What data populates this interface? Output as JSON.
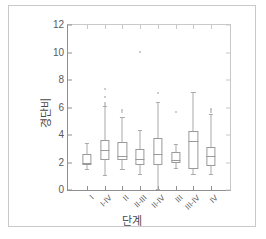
{
  "chart_data": {
    "type": "box",
    "title": "",
    "xlabel": "단계",
    "ylabel": "경단비",
    "ylim": [
      0,
      12
    ],
    "yticks": [
      0,
      2,
      4,
      6,
      8,
      10,
      12
    ],
    "ytick_labels": [
      "0",
      "2",
      "4",
      "6",
      "8",
      "10",
      "12"
    ],
    "grid": false,
    "legend": "none",
    "categories": [
      "I",
      "I-IV",
      "II",
      "II-III",
      "II-IV",
      "III",
      "III-IV",
      "IV"
    ],
    "boxes": [
      {
        "category": "I",
        "whisker_low": 1.55,
        "q1": 1.8,
        "median": 2.0,
        "q3": 2.6,
        "whisker_high": 3.4,
        "outliers": []
      },
      {
        "category": "I-IV",
        "whisker_low": 1.1,
        "q1": 2.15,
        "median": 2.9,
        "q3": 3.65,
        "whisker_high": 6.1,
        "outliers": [
          6.3,
          6.5,
          6.9,
          7.5
        ]
      },
      {
        "category": "II",
        "whisker_low": 1.5,
        "q1": 2.15,
        "median": 2.5,
        "q3": 3.5,
        "whisker_high": 5.3,
        "outliers": [
          5.8,
          6.0
        ]
      },
      {
        "category": "II-III",
        "whisker_low": 1.15,
        "q1": 1.85,
        "median": 2.25,
        "q3": 2.95,
        "whisker_high": 4.35,
        "outliers": [
          10.2
        ]
      },
      {
        "category": "II-IV",
        "whisker_low": 0.1,
        "q1": 1.85,
        "median": 2.6,
        "q3": 3.8,
        "whisker_high": 6.4,
        "outliers": [
          7.2
        ]
      },
      {
        "category": "III",
        "whisker_low": 1.6,
        "q1": 2.0,
        "median": 2.15,
        "q3": 2.75,
        "whisker_high": 3.35,
        "outliers": [
          5.8
        ]
      },
      {
        "category": "III-IV",
        "whisker_low": 1.2,
        "q1": 1.5,
        "median": 3.55,
        "q3": 4.3,
        "whisker_high": 7.15,
        "outliers": []
      },
      {
        "category": "IV",
        "whisker_low": 1.2,
        "q1": 1.75,
        "median": 2.45,
        "q3": 3.15,
        "whisker_high": 5.5,
        "outliers": [
          5.85,
          5.95,
          6.05
        ]
      }
    ]
  }
}
